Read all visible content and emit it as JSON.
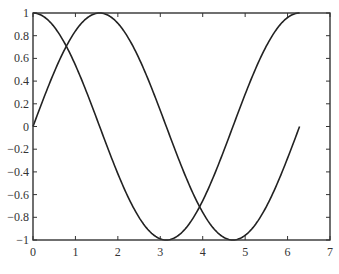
{
  "chart_data": {
    "type": "line",
    "title": "",
    "xlabel": "",
    "ylabel": "",
    "xlim": [
      0,
      7
    ],
    "ylim": [
      -1,
      1
    ],
    "grid": false,
    "legend": null,
    "x_ticks": [
      0,
      1,
      2,
      3,
      4,
      5,
      6,
      7
    ],
    "x_tick_labels": [
      "0",
      "1",
      "2",
      "3",
      "4",
      "5",
      "6",
      "7"
    ],
    "y_ticks": [
      1,
      0.8,
      0.6,
      0.4,
      0.2,
      0,
      -0.2,
      -0.4,
      -0.6,
      -0.8,
      -1
    ],
    "y_tick_labels": [
      "1",
      "0.8",
      "0.6",
      "0.4",
      "0.2",
      "0",
      "−0.2",
      "−0.4",
      "−0.6",
      "−0.8",
      "−1"
    ],
    "series": [
      {
        "name": "sin(x)",
        "function": "sin",
        "x_range": [
          0,
          6.2832
        ],
        "color": "#222222",
        "x": [
          0,
          0.5,
          1.0,
          1.5708,
          2.0,
          2.5,
          3.0,
          3.5,
          4.0,
          4.7124,
          5.0,
          5.5,
          6.0,
          6.2832
        ],
        "y": [
          0.0,
          0.479,
          0.841,
          1.0,
          0.909,
          0.598,
          0.141,
          -0.351,
          -0.757,
          -1.0,
          -0.959,
          -0.706,
          -0.279,
          0.0
        ]
      },
      {
        "name": "cos(x)",
        "function": "cos",
        "x_range": [
          0,
          6.2832
        ],
        "color": "#222222",
        "x": [
          0,
          0.5,
          1.0,
          1.5708,
          2.0,
          2.5,
          3.1416,
          3.5,
          4.0,
          4.5,
          5.0,
          5.5,
          6.0,
          6.2832
        ],
        "y": [
          1.0,
          0.878,
          0.54,
          0.0,
          -0.416,
          -0.801,
          -1.0,
          -0.936,
          -0.654,
          -0.211,
          0.284,
          0.709,
          0.96,
          1.0
        ]
      }
    ],
    "plot_box": {
      "left": 33,
      "top": 13,
      "right": 330,
      "bottom": 240
    },
    "line_color": "#222222",
    "axis_color": "#333333"
  }
}
